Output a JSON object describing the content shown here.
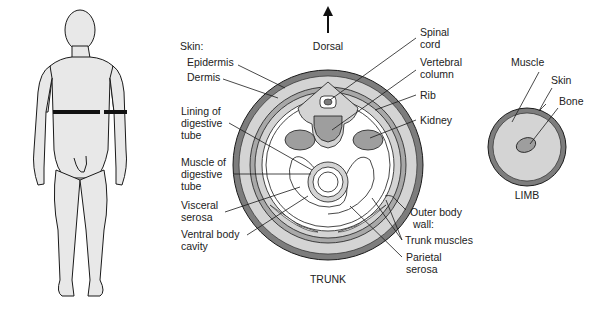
{
  "figure": {
    "colors": {
      "skin_outer": "#7d7d7d",
      "dermis": "#a8a8a8",
      "muscle_fill": "#d4d4d4",
      "organ_fill": "#9e9e9e",
      "body_fill": "#e8e8e8",
      "line": "#1a1a1a",
      "section_marker": "#111111"
    },
    "human": {
      "name": "Human figure with cross-section plane marked"
    },
    "trunk": {
      "title": "TRUNK",
      "orientation_label": "Dorsal",
      "skin_heading": "Skin:",
      "labels_left": [
        {
          "id": "epidermis",
          "lines": [
            "Epidermis"
          ]
        },
        {
          "id": "dermis",
          "lines": [
            "Dermis"
          ]
        },
        {
          "id": "lining",
          "lines": [
            "Lining of",
            "digestive",
            "tube"
          ]
        },
        {
          "id": "muscle-digestive",
          "lines": [
            "Muscle of",
            "digestive",
            "tube"
          ]
        },
        {
          "id": "visceral-serosa",
          "lines": [
            "Visceral",
            "serosa"
          ]
        },
        {
          "id": "ventral-cavity",
          "lines": [
            "Ventral body",
            "cavity"
          ]
        }
      ],
      "labels_right": [
        {
          "id": "spinal-cord",
          "lines": [
            "Spinal",
            "cord"
          ]
        },
        {
          "id": "vertebral-column",
          "lines": [
            "Vertebral",
            "column"
          ]
        },
        {
          "id": "rib",
          "lines": [
            "Rib"
          ]
        },
        {
          "id": "kidney",
          "lines": [
            "Kidney"
          ]
        },
        {
          "id": "outer-body-wall",
          "lines": [
            "Outer body",
            "wall:"
          ]
        },
        {
          "id": "trunk-muscles",
          "lines": [
            "Trunk muscles"
          ]
        },
        {
          "id": "parietal-serosa",
          "lines": [
            "Parietal",
            "serosa"
          ]
        }
      ]
    },
    "limb": {
      "title": "LIMB",
      "labels": [
        {
          "id": "muscle",
          "lines": [
            "Muscle"
          ]
        },
        {
          "id": "skin",
          "lines": [
            "Skin"
          ]
        },
        {
          "id": "bone",
          "lines": [
            "Bone"
          ]
        }
      ]
    }
  }
}
